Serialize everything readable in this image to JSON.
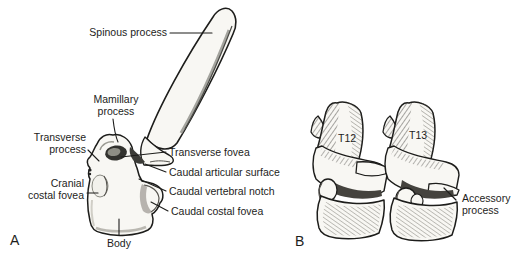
{
  "figure": {
    "type": "anatomical line drawing of thoracic vertebrae",
    "colors": {
      "background": "#ffffff",
      "ink": "#1d1d1b",
      "bone_fill": "#f8f7f3",
      "shade": "#8f8f88",
      "dark_shade": "#3c3c38"
    },
    "panelA": {
      "letter": "A",
      "labels": {
        "spinous": "Spinous process",
        "mamillary": "Mamillary process",
        "transverse_process": "Transverse process",
        "transverse_fovea": "Transverse fovea",
        "caudal_articular_surface": "Caudal articular surface",
        "caudal_vertebral_notch": "Caudal vertebral notch",
        "cranial_costal_fovea": "Cranial costal fovea",
        "caudal_costal_fovea": "Caudal costal fovea",
        "body": "Body"
      }
    },
    "panelB": {
      "letter": "B",
      "vertebrae": [
        {
          "id": "T12"
        },
        {
          "id": "T13"
        }
      ],
      "labels": {
        "accessory": "Accessory process"
      }
    }
  }
}
